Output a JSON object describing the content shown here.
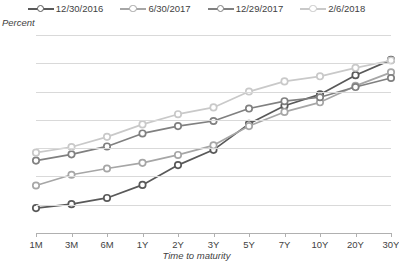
{
  "axis": {
    "y_title": "Percent",
    "x_title": "Time to maturity",
    "y_ticks": [
      "0.0",
      "0.5",
      "1.0",
      "1.5",
      "2.0",
      "2.5",
      "3.0",
      "3.5"
    ]
  },
  "source_note": "",
  "legend": [
    {
      "label": "12/30/2016",
      "color": "#595959"
    },
    {
      "label": "6/30/2017",
      "color": "#a6a6a6"
    },
    {
      "label": "12/29/2017",
      "color": "#808080"
    },
    {
      "label": "2/6/2018",
      "color": "#c9c9c9"
    }
  ],
  "chart_data": {
    "type": "line",
    "title": "",
    "xlabel": "Time to maturity",
    "ylabel": "Percent",
    "categories": [
      "1M",
      "3M",
      "6M",
      "1Y",
      "2Y",
      "3Y",
      "5Y",
      "7Y",
      "10Y",
      "20Y",
      "30Y"
    ],
    "ylim": [
      0.0,
      3.5
    ],
    "ytick_step": 0.5,
    "grid": true,
    "legend_position": "top",
    "series": [
      {
        "name": "12/30/2016",
        "color": "#595959",
        "values": [
          0.44,
          0.51,
          0.62,
          0.85,
          1.2,
          1.47,
          1.93,
          2.25,
          2.45,
          2.79,
          3.06
        ]
      },
      {
        "name": "6/30/2017",
        "color": "#a6a6a6",
        "values": [
          0.84,
          1.03,
          1.14,
          1.24,
          1.38,
          1.55,
          1.89,
          2.14,
          2.31,
          2.6,
          2.84
        ]
      },
      {
        "name": "12/29/2017",
        "color": "#808080",
        "values": [
          1.28,
          1.39,
          1.53,
          1.76,
          1.89,
          1.98,
          2.2,
          2.33,
          2.4,
          2.58,
          2.74
        ]
      },
      {
        "name": "2/6/2018",
        "color": "#c9c9c9",
        "values": [
          1.42,
          1.52,
          1.7,
          1.92,
          2.1,
          2.22,
          2.5,
          2.68,
          2.77,
          2.92,
          3.05
        ]
      }
    ]
  }
}
